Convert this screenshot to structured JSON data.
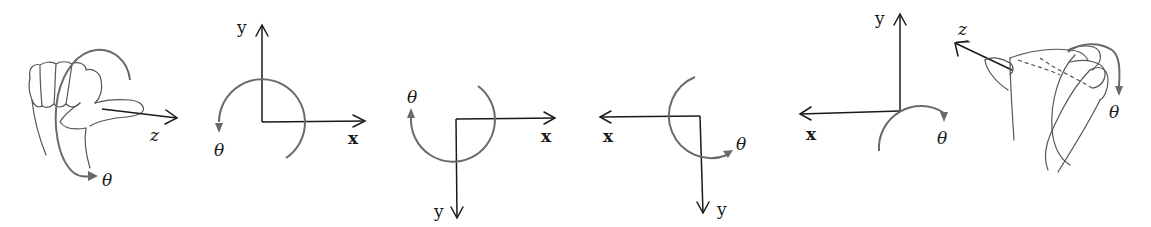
{
  "figure": {
    "panels": [
      {
        "id": "right-hand-z-out",
        "labels": {
          "z": "z",
          "theta": "θ"
        }
      },
      {
        "id": "frame-y-up-x-right",
        "labels": {
          "x": "x",
          "y": "y",
          "theta": "θ"
        },
        "rotation": "counterclockwise"
      },
      {
        "id": "frame-y-down-x-right",
        "labels": {
          "x": "x",
          "y": "y",
          "theta": "θ"
        },
        "rotation": "clockwise"
      },
      {
        "id": "frame-y-down-x-left",
        "labels": {
          "x": "x",
          "y": "y",
          "theta": "θ"
        },
        "rotation": "counterclockwise"
      },
      {
        "id": "frame-y-up-x-left",
        "labels": {
          "x": "x",
          "y": "y",
          "theta": "θ",
          "z": "z"
        },
        "rotation": "clockwise"
      },
      {
        "id": "right-hand-z-in",
        "labels": {
          "theta": "θ"
        }
      }
    ],
    "colors": {
      "axis": "#1a1a1a",
      "arc": "#6a6a6a",
      "hand": "#555555",
      "background": "#ffffff"
    }
  }
}
